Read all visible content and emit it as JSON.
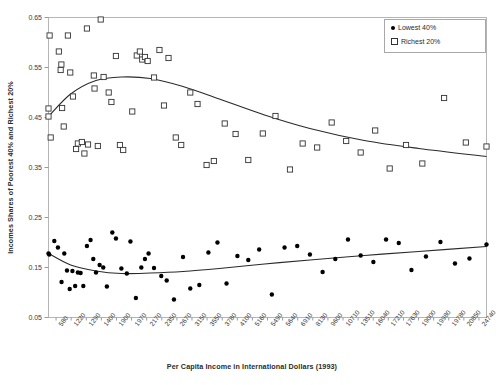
{
  "chart_data": {
    "type": "scatter",
    "title": "",
    "xlabel": "Per Capita Income in International Dollars (1993)",
    "ylabel": "Incomes Shares of Poorest 40% and Richest 20%",
    "grid": false,
    "legend_position": "top-right",
    "ylim": [
      0.05,
      0.65
    ],
    "yticks": [
      "0.65",
      "0.55",
      "0.45",
      "0.35",
      "0.25",
      "0.15",
      "0.05"
    ],
    "categories": [
      "580",
      "1220",
      "1290",
      "1400",
      "1900",
      "1970",
      "2170",
      "2350",
      "2670",
      "3150",
      "3550",
      "3780",
      "4100",
      "5160",
      "5490",
      "5640",
      "6910",
      "8130",
      "9600",
      "10710",
      "13510",
      "16040",
      "17210",
      "17630",
      "19000",
      "19980",
      "19780",
      "20850",
      "24740"
    ],
    "series": [
      {
        "name": "Richest 20%",
        "marker": "open-square",
        "color": "#333333",
        "points": [
          [
            580,
            0.468
          ],
          [
            580,
            0.452
          ],
          [
            640,
            0.614
          ],
          [
            700,
            0.41
          ],
          [
            1150,
            0.582
          ],
          [
            1250,
            0.545
          ],
          [
            1290,
            0.556
          ],
          [
            1330,
            0.469
          ],
          [
            1420,
            0.432
          ],
          [
            1650,
            0.614
          ],
          [
            1780,
            0.54
          ],
          [
            1930,
            0.492
          ],
          [
            2100,
            0.387
          ],
          [
            2200,
            0.398
          ],
          [
            2420,
            0.401
          ],
          [
            2560,
            0.378
          ],
          [
            2700,
            0.628
          ],
          [
            2760,
            0.396
          ],
          [
            3080,
            0.534
          ],
          [
            3120,
            0.508
          ],
          [
            3300,
            0.393
          ],
          [
            3460,
            0.646
          ],
          [
            3620,
            0.531
          ],
          [
            3900,
            0.5
          ],
          [
            4050,
            0.481
          ],
          [
            4300,
            0.573
          ],
          [
            4520,
            0.395
          ],
          [
            4700,
            0.385
          ],
          [
            5200,
            0.462
          ],
          [
            5450,
            0.574
          ],
          [
            5620,
            0.582
          ],
          [
            5750,
            0.566
          ],
          [
            5900,
            0.571
          ],
          [
            6050,
            0.563
          ],
          [
            6400,
            0.53
          ],
          [
            6700,
            0.585
          ],
          [
            6950,
            0.474
          ],
          [
            7200,
            0.569
          ],
          [
            7600,
            0.41
          ],
          [
            7900,
            0.395
          ],
          [
            8400,
            0.5
          ],
          [
            8800,
            0.477
          ],
          [
            9300,
            0.355
          ],
          [
            9700,
            0.363
          ],
          [
            10300,
            0.438
          ],
          [
            10900,
            0.417
          ],
          [
            11600,
            0.365
          ],
          [
            12400,
            0.418
          ],
          [
            13100,
            0.453
          ],
          [
            13900,
            0.346
          ],
          [
            14600,
            0.398
          ],
          [
            15400,
            0.39
          ],
          [
            16200,
            0.44
          ],
          [
            17000,
            0.403
          ],
          [
            17800,
            0.38
          ],
          [
            18600,
            0.424
          ],
          [
            19400,
            0.348
          ],
          [
            20300,
            0.395
          ],
          [
            21200,
            0.358
          ],
          [
            22400,
            0.489
          ],
          [
            23600,
            0.4
          ],
          [
            24740,
            0.392
          ]
        ],
        "fit": [
          [
            580,
            0.452
          ],
          [
            1800,
            0.497
          ],
          [
            3200,
            0.524
          ],
          [
            4600,
            0.531
          ],
          [
            6200,
            0.528
          ],
          [
            8000,
            0.512
          ],
          [
            10000,
            0.487
          ],
          [
            12500,
            0.455
          ],
          [
            15000,
            0.428
          ],
          [
            18000,
            0.404
          ],
          [
            21000,
            0.388
          ],
          [
            24740,
            0.372
          ]
        ]
      },
      {
        "name": "Lowest 40%",
        "marker": "filled-circle",
        "color": "#000000",
        "points": [
          [
            580,
            0.178
          ],
          [
            620,
            0.176
          ],
          [
            900,
            0.203
          ],
          [
            1100,
            0.19
          ],
          [
            1300,
            0.121
          ],
          [
            1450,
            0.178
          ],
          [
            1600,
            0.144
          ],
          [
            1750,
            0.107
          ],
          [
            1900,
            0.143
          ],
          [
            2050,
            0.113
          ],
          [
            2200,
            0.14
          ],
          [
            2350,
            0.139
          ],
          [
            2500,
            0.113
          ],
          [
            2700,
            0.193
          ],
          [
            2900,
            0.205
          ],
          [
            3050,
            0.167
          ],
          [
            3200,
            0.14
          ],
          [
            3400,
            0.155
          ],
          [
            3600,
            0.15
          ],
          [
            3800,
            0.112
          ],
          [
            4100,
            0.22
          ],
          [
            4300,
            0.208
          ],
          [
            4600,
            0.148
          ],
          [
            4900,
            0.138
          ],
          [
            5100,
            0.202
          ],
          [
            5400,
            0.089
          ],
          [
            5700,
            0.15
          ],
          [
            5900,
            0.167
          ],
          [
            6100,
            0.178
          ],
          [
            6400,
            0.149
          ],
          [
            6800,
            0.133
          ],
          [
            7100,
            0.124
          ],
          [
            7500,
            0.086
          ],
          [
            8000,
            0.171
          ],
          [
            8400,
            0.108
          ],
          [
            8900,
            0.115
          ],
          [
            9400,
            0.18
          ],
          [
            9900,
            0.2
          ],
          [
            10400,
            0.118
          ],
          [
            11000,
            0.173
          ],
          [
            11600,
            0.165
          ],
          [
            12200,
            0.186
          ],
          [
            12900,
            0.096
          ],
          [
            13600,
            0.19
          ],
          [
            14300,
            0.193
          ],
          [
            15000,
            0.176
          ],
          [
            15700,
            0.141
          ],
          [
            16400,
            0.167
          ],
          [
            17100,
            0.206
          ],
          [
            17800,
            0.174
          ],
          [
            18500,
            0.161
          ],
          [
            19200,
            0.206
          ],
          [
            19900,
            0.199
          ],
          [
            20600,
            0.145
          ],
          [
            21400,
            0.172
          ],
          [
            22200,
            0.201
          ],
          [
            23000,
            0.158
          ],
          [
            23800,
            0.168
          ],
          [
            24740,
            0.196
          ]
        ],
        "fit": [
          [
            580,
            0.178
          ],
          [
            1800,
            0.155
          ],
          [
            3200,
            0.143
          ],
          [
            4600,
            0.138
          ],
          [
            6200,
            0.139
          ],
          [
            8000,
            0.142
          ],
          [
            10000,
            0.148
          ],
          [
            12500,
            0.157
          ],
          [
            15000,
            0.165
          ],
          [
            18000,
            0.174
          ],
          [
            21000,
            0.182
          ],
          [
            24740,
            0.192
          ]
        ]
      }
    ],
    "legend": [
      {
        "label": "Lowest 40%",
        "marker": "filled-circle"
      },
      {
        "label": "Richest 20%",
        "marker": "open-square"
      }
    ]
  },
  "colors": {
    "frame": "#b5b5b5",
    "axis_text": "#3a3a3a",
    "fit_line": "#2a2a2a",
    "marker_open": "#333333",
    "marker_filled": "#000000"
  }
}
